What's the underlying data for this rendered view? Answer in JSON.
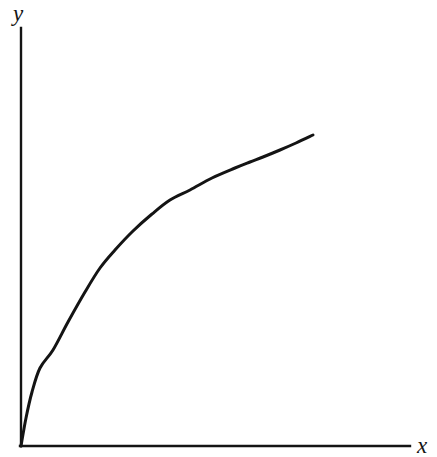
{
  "figure": {
    "background_color": "#ffffff",
    "ink_color": "#141414",
    "width": 437,
    "height": 457
  },
  "labels": {
    "y_axis": "y",
    "x_axis": "x"
  },
  "chart_data": {
    "type": "line",
    "title": "",
    "subtitle": "",
    "xlabel": "x",
    "ylabel": "y",
    "grid": false,
    "legend": null,
    "annotations": [],
    "axis_style": "bare-arrowless-axes-from-origin",
    "xlim": [
      0,
      1.18
    ],
    "ylim": [
      0,
      1.18
    ],
    "x_tick_labels": [],
    "y_tick_labels": [],
    "origin_px": [
      21,
      446
    ],
    "y_axis_top_px": [
      21,
      28
    ],
    "x_axis_right_px": [
      410,
      446
    ],
    "curve_color": "#141414",
    "curve_width_px": 3,
    "axis_width_px": 2,
    "series": [
      {
        "name": "curve",
        "points_px": [
          [
            21,
            446
          ],
          [
            26,
            418
          ],
          [
            32,
            392
          ],
          [
            40,
            368
          ],
          [
            53,
            350
          ],
          [
            68,
            322
          ],
          [
            85,
            292
          ],
          [
            100,
            268
          ],
          [
            115,
            250
          ],
          [
            133,
            231
          ],
          [
            152,
            214
          ],
          [
            170,
            200
          ],
          [
            190,
            190
          ],
          [
            212,
            178
          ],
          [
            235,
            168
          ],
          [
            250,
            162
          ],
          [
            263,
            157
          ],
          [
            280,
            150
          ],
          [
            296,
            143
          ],
          [
            313,
            135
          ]
        ],
        "x": [
          0.0,
          0.01,
          0.03,
          0.05,
          0.08,
          0.12,
          0.16,
          0.2,
          0.24,
          0.29,
          0.34,
          0.38,
          0.43,
          0.49,
          0.55,
          0.59,
          0.62,
          0.67,
          0.71,
          0.75
        ],
        "y": [
          0.0,
          0.07,
          0.13,
          0.19,
          0.23,
          0.3,
          0.37,
          0.43,
          0.47,
          0.51,
          0.56,
          0.59,
          0.61,
          0.64,
          0.67,
          0.68,
          0.69,
          0.71,
          0.73,
          0.74
        ]
      }
    ]
  }
}
